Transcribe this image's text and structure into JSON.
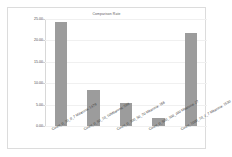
{
  "chart_data": {
    "type": "bar",
    "title": "Comparison Rate",
    "xlabel": "",
    "ylabel": "",
    "categories": [
      "Count_0_10_0_7 Mitarona: 1479",
      "Count_0_50_10_10Mitarona: 598",
      "Count_0_100_50_70 Mitarona: 166",
      "Count_0_500_100_200 Mitarona: 27",
      "Count_1000_10_2_7 Mitarona: 1530"
    ],
    "values": [
      24.3,
      8.3,
      5.4,
      1.8,
      21.8
    ],
    "ylim": [
      0.0,
      25.0
    ],
    "yticks": [
      0.0,
      5.0,
      10.0,
      15.0,
      20.0,
      25.0
    ],
    "ytick_labels": [
      "0.00",
      "5.00",
      "10.00",
      "15.00",
      "20.00",
      "25.00"
    ],
    "grid": true,
    "legend": false,
    "bar_color": "#9c9c9c",
    "grid_color": "#f0f0f0",
    "axis_color": "#d8d8d8",
    "background": "#ffffff",
    "border_color": "#dcdcdc"
  }
}
